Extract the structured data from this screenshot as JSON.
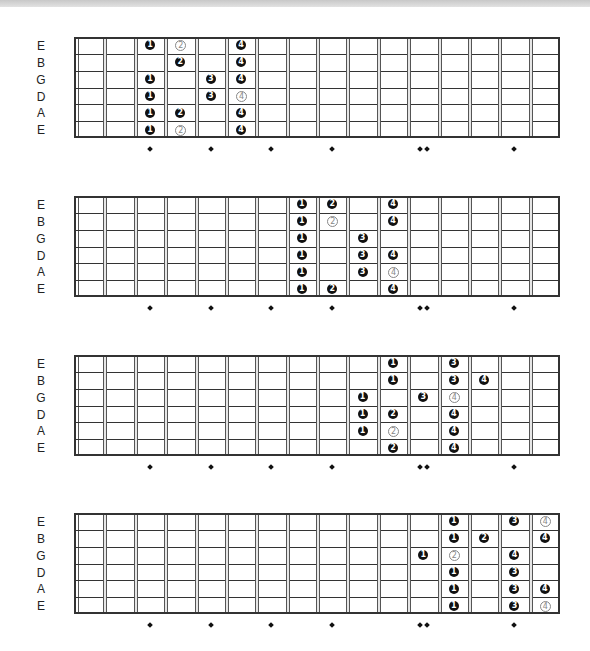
{
  "strings": [
    "E",
    "B",
    "G",
    "D",
    "A",
    "E"
  ],
  "fret_count": 16,
  "inlay_frets": [
    3,
    5,
    7,
    9,
    12,
    15
  ],
  "double_inlay_frets": [
    12
  ],
  "colors": {
    "filled": "#111111",
    "outline": "#888888",
    "line": "#333333"
  },
  "diagrams": [
    {
      "name": "position-1",
      "top": 37,
      "notes": [
        {
          "string": 0,
          "fret": 3,
          "finger": "1",
          "style": "filled"
        },
        {
          "string": 0,
          "fret": 4,
          "finger": "2",
          "style": "outline"
        },
        {
          "string": 0,
          "fret": 6,
          "finger": "4",
          "style": "filled"
        },
        {
          "string": 1,
          "fret": 4,
          "finger": "2",
          "style": "filled"
        },
        {
          "string": 1,
          "fret": 6,
          "finger": "4",
          "style": "filled"
        },
        {
          "string": 2,
          "fret": 3,
          "finger": "1",
          "style": "filled"
        },
        {
          "string": 2,
          "fret": 5,
          "finger": "3",
          "style": "filled"
        },
        {
          "string": 2,
          "fret": 6,
          "finger": "4",
          "style": "filled"
        },
        {
          "string": 3,
          "fret": 3,
          "finger": "1",
          "style": "filled"
        },
        {
          "string": 3,
          "fret": 5,
          "finger": "3",
          "style": "filled"
        },
        {
          "string": 3,
          "fret": 6,
          "finger": "4",
          "style": "outline"
        },
        {
          "string": 4,
          "fret": 3,
          "finger": "1",
          "style": "filled"
        },
        {
          "string": 4,
          "fret": 4,
          "finger": "2",
          "style": "filled"
        },
        {
          "string": 4,
          "fret": 6,
          "finger": "4",
          "style": "filled"
        },
        {
          "string": 5,
          "fret": 3,
          "finger": "1",
          "style": "filled"
        },
        {
          "string": 5,
          "fret": 4,
          "finger": "2",
          "style": "outline"
        },
        {
          "string": 5,
          "fret": 6,
          "finger": "4",
          "style": "filled"
        }
      ]
    },
    {
      "name": "position-2",
      "top": 196,
      "notes": [
        {
          "string": 0,
          "fret": 8,
          "finger": "1",
          "style": "filled"
        },
        {
          "string": 0,
          "fret": 9,
          "finger": "2",
          "style": "filled"
        },
        {
          "string": 0,
          "fret": 11,
          "finger": "4",
          "style": "filled"
        },
        {
          "string": 1,
          "fret": 8,
          "finger": "1",
          "style": "filled"
        },
        {
          "string": 1,
          "fret": 9,
          "finger": "2",
          "style": "outline"
        },
        {
          "string": 1,
          "fret": 11,
          "finger": "4",
          "style": "filled"
        },
        {
          "string": 2,
          "fret": 8,
          "finger": "1",
          "style": "filled"
        },
        {
          "string": 2,
          "fret": 10,
          "finger": "3",
          "style": "filled"
        },
        {
          "string": 3,
          "fret": 8,
          "finger": "1",
          "style": "filled"
        },
        {
          "string": 3,
          "fret": 10,
          "finger": "3",
          "style": "filled"
        },
        {
          "string": 3,
          "fret": 11,
          "finger": "4",
          "style": "filled"
        },
        {
          "string": 4,
          "fret": 8,
          "finger": "1",
          "style": "filled"
        },
        {
          "string": 4,
          "fret": 10,
          "finger": "3",
          "style": "filled"
        },
        {
          "string": 4,
          "fret": 11,
          "finger": "4",
          "style": "outline"
        },
        {
          "string": 5,
          "fret": 8,
          "finger": "1",
          "style": "filled"
        },
        {
          "string": 5,
          "fret": 9,
          "finger": "2",
          "style": "filled"
        },
        {
          "string": 5,
          "fret": 11,
          "finger": "4",
          "style": "filled"
        }
      ]
    },
    {
      "name": "position-3",
      "top": 355,
      "notes": [
        {
          "string": 0,
          "fret": 11,
          "finger": "1",
          "style": "filled"
        },
        {
          "string": 0,
          "fret": 13,
          "finger": "3",
          "style": "filled"
        },
        {
          "string": 1,
          "fret": 11,
          "finger": "1",
          "style": "filled"
        },
        {
          "string": 1,
          "fret": 13,
          "finger": "3",
          "style": "filled"
        },
        {
          "string": 1,
          "fret": 14,
          "finger": "4",
          "style": "filled"
        },
        {
          "string": 2,
          "fret": 10,
          "finger": "1",
          "style": "filled"
        },
        {
          "string": 2,
          "fret": 12,
          "finger": "3",
          "style": "filled"
        },
        {
          "string": 2,
          "fret": 13,
          "finger": "4",
          "style": "outline"
        },
        {
          "string": 3,
          "fret": 10,
          "finger": "1",
          "style": "filled"
        },
        {
          "string": 3,
          "fret": 11,
          "finger": "2",
          "style": "filled"
        },
        {
          "string": 3,
          "fret": 13,
          "finger": "4",
          "style": "filled"
        },
        {
          "string": 4,
          "fret": 10,
          "finger": "1",
          "style": "filled"
        },
        {
          "string": 4,
          "fret": 11,
          "finger": "2",
          "style": "outline"
        },
        {
          "string": 4,
          "fret": 13,
          "finger": "4",
          "style": "filled"
        },
        {
          "string": 5,
          "fret": 11,
          "finger": "2",
          "style": "filled"
        },
        {
          "string": 5,
          "fret": 13,
          "finger": "4",
          "style": "filled"
        }
      ]
    },
    {
      "name": "position-4",
      "top": 513,
      "notes": [
        {
          "string": 0,
          "fret": 13,
          "finger": "1",
          "style": "filled"
        },
        {
          "string": 0,
          "fret": 15,
          "finger": "3",
          "style": "filled"
        },
        {
          "string": 0,
          "fret": 16,
          "finger": "4",
          "style": "outline"
        },
        {
          "string": 1,
          "fret": 13,
          "finger": "1",
          "style": "filled"
        },
        {
          "string": 1,
          "fret": 14,
          "finger": "2",
          "style": "filled"
        },
        {
          "string": 1,
          "fret": 16,
          "finger": "4",
          "style": "filled"
        },
        {
          "string": 2,
          "fret": 12,
          "finger": "1",
          "style": "filled"
        },
        {
          "string": 2,
          "fret": 13,
          "finger": "2",
          "style": "outline"
        },
        {
          "string": 2,
          "fret": 15,
          "finger": "4",
          "style": "filled"
        },
        {
          "string": 3,
          "fret": 13,
          "finger": "1",
          "style": "filled"
        },
        {
          "string": 3,
          "fret": 15,
          "finger": "3",
          "style": "filled"
        },
        {
          "string": 4,
          "fret": 13,
          "finger": "1",
          "style": "filled"
        },
        {
          "string": 4,
          "fret": 15,
          "finger": "3",
          "style": "filled"
        },
        {
          "string": 4,
          "fret": 16,
          "finger": "4",
          "style": "filled"
        },
        {
          "string": 5,
          "fret": 13,
          "finger": "1",
          "style": "filled"
        },
        {
          "string": 5,
          "fret": 15,
          "finger": "3",
          "style": "filled"
        },
        {
          "string": 5,
          "fret": 16,
          "finger": "4",
          "style": "outline"
        }
      ]
    }
  ]
}
